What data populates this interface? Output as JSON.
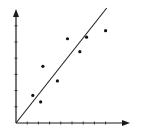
{
  "chart_data": {
    "type": "scatter",
    "title": "",
    "xlabel": "",
    "ylabel": "",
    "grid": false,
    "legend": null,
    "axis_style": "arrowed axes, no tick labels",
    "x_ticks_count": 8,
    "y_ticks_count": 6,
    "xlim": [
      0,
      10
    ],
    "ylim": [
      0,
      7
    ],
    "points": [
      {
        "x": 1.5,
        "y": 1.7
      },
      {
        "x": 2.2,
        "y": 1.3
      },
      {
        "x": 2.4,
        "y": 3.5
      },
      {
        "x": 3.7,
        "y": 2.6
      },
      {
        "x": 4.6,
        "y": 5.2
      },
      {
        "x": 5.7,
        "y": 4.4
      },
      {
        "x": 6.3,
        "y": 5.3
      },
      {
        "x": 8.0,
        "y": 5.7
      }
    ],
    "trend_line": {
      "x0": 0,
      "y0": 0,
      "x1": 8.1,
      "y1": 7.1
    },
    "colors": {
      "axis": "#1a1a1a",
      "points": "#111111",
      "line": "#222222",
      "background": "#ffffff"
    }
  },
  "layout": {
    "origin_px": [
      16,
      123
    ],
    "x_end_px": 130,
    "y_end_px": 9,
    "x_unit_px": 11.2,
    "y_unit_px": 16.2
  }
}
